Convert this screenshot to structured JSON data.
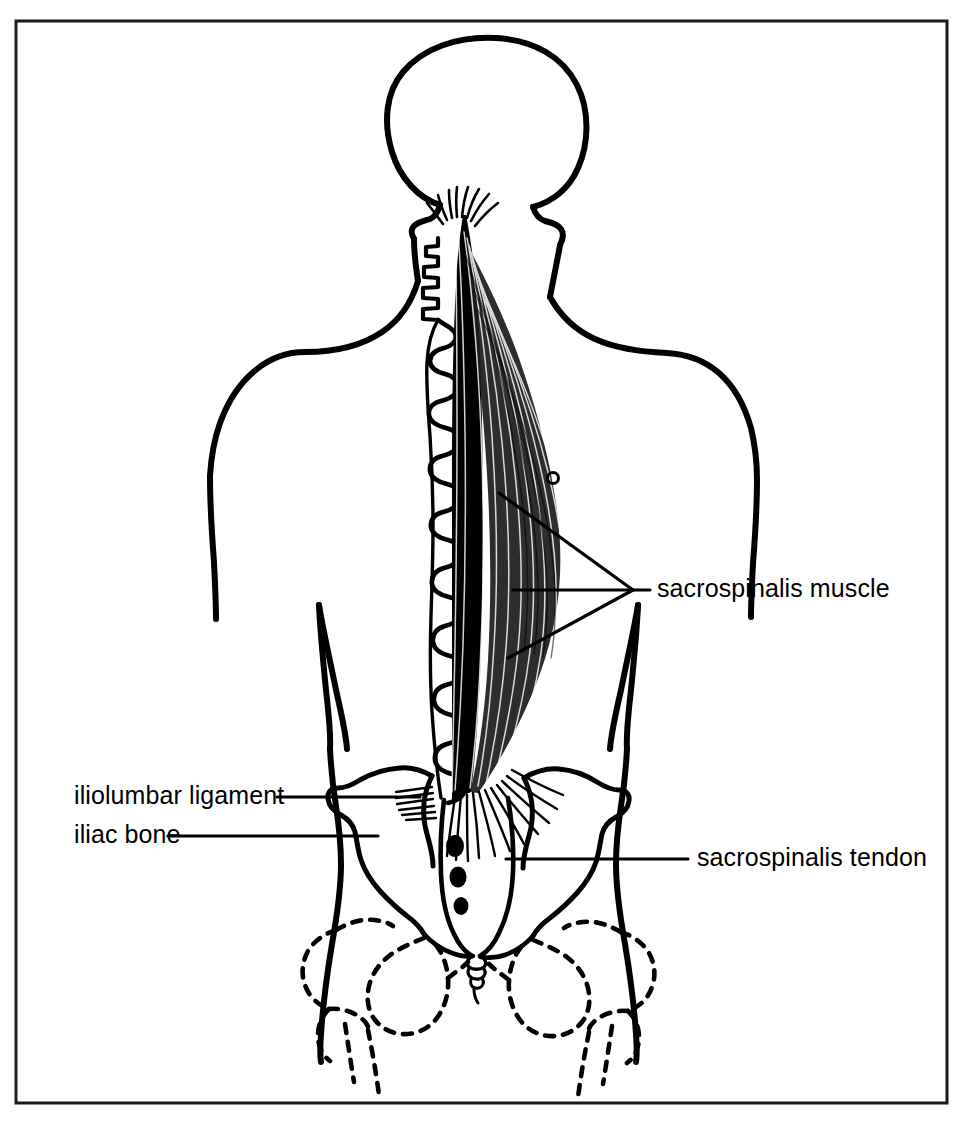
{
  "figure": {
    "border_color": "#1a1a1a",
    "ink_color": "#000000",
    "background_color": "#ffffff"
  },
  "labels": [
    {
      "id": "sacrospinalis-muscle",
      "text": "sacrospinalis muscle",
      "text_x": 657,
      "text_y": 597,
      "anchor": "start",
      "leader_kind": "three-branch-converging",
      "leader_tip_x": 633,
      "leader_tip_y": 590,
      "leader_text_x": 650,
      "branches": [
        {
          "x": 499,
          "y": 493
        },
        {
          "x": 513,
          "y": 590
        },
        {
          "x": 508,
          "y": 658
        }
      ]
    },
    {
      "id": "iliolumbar-ligament",
      "text": "iliolumbar ligament",
      "text_x": 74,
      "text_y": 804,
      "anchor": "start",
      "leader_kind": "straight",
      "leader_x1": 277,
      "leader_y1": 797,
      "leader_x2": 420,
      "leader_y2": 797
    },
    {
      "id": "iliac-bone",
      "text": "iliac bone",
      "text_x": 74,
      "text_y": 843,
      "anchor": "start",
      "leader_kind": "straight",
      "leader_x1": 168,
      "leader_y1": 836,
      "leader_x2": 378,
      "leader_y2": 836
    },
    {
      "id": "sacrospinalis-tendon",
      "text": "sacrospinalis tendon",
      "text_x": 697,
      "text_y": 866,
      "anchor": "start",
      "leader_kind": "straight",
      "leader_x1": 506,
      "leader_y1": 859,
      "leader_x2": 688,
      "leader_y2": 859
    }
  ],
  "frame": {
    "x": 16,
    "y": 21,
    "width": 931,
    "height": 1082,
    "stroke_width": 3
  },
  "anatomy": {
    "parts": [
      "skull",
      "neck",
      "shoulders",
      "torso-outline",
      "arms",
      "vertebral-column",
      "sacrospinalis-muscle-fibers",
      "sacrospinalis-tendon-fibers",
      "iliolumbar-ligament-fibers",
      "iliac-bones",
      "sacrum",
      "sacral-foramina",
      "coccyx",
      "ischium-dashed",
      "pubis-dashed",
      "femur-dashed"
    ],
    "marker_circle": {
      "cx": 553,
      "cy": 478,
      "r": 5
    }
  }
}
